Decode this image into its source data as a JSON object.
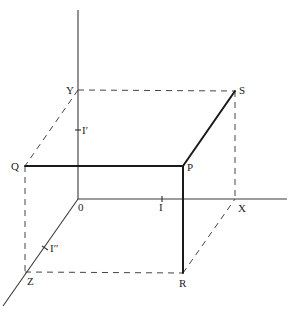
{
  "figure": {
    "width": 291,
    "height": 312,
    "colors": {
      "background": "#ffffff",
      "line": "#1a1a1a",
      "axis": "#3a3a3a",
      "dashed": "#444444",
      "text": "#222222"
    }
  },
  "axes": {
    "origin": {
      "label": "0",
      "x": 78,
      "y": 199
    },
    "y_axis": {
      "from": [
        78,
        199
      ],
      "to": [
        78,
        10
      ]
    },
    "x_axis": {
      "from": [
        78,
        199
      ],
      "to": [
        287,
        199
      ]
    },
    "z_axis": {
      "from": [
        78,
        199
      ],
      "to": [
        3,
        306
      ]
    }
  },
  "points": {
    "Y": {
      "label": "Y",
      "x": 78,
      "y": 90
    },
    "S": {
      "label": "S",
      "x": 235,
      "y": 91
    },
    "Q": {
      "label": "Q",
      "x": 25,
      "y": 166
    },
    "P": {
      "label": "P",
      "x": 183,
      "y": 166
    },
    "X": {
      "label": "X",
      "x": 235,
      "y": 199
    },
    "Z": {
      "label": "Z",
      "x": 25,
      "y": 272
    },
    "R": {
      "label": "R",
      "x": 183,
      "y": 273
    }
  },
  "unit_ticks": {
    "x_unit": {
      "label": "I",
      "x": 162,
      "y": 199
    },
    "y_unit": {
      "label": "I′",
      "x": 78,
      "y": 130
    },
    "z_unit": {
      "label": "I′′",
      "x": 45,
      "y": 248
    }
  },
  "solid_segments": [
    {
      "name": "segment-q-p",
      "from": "Q",
      "to": "P"
    },
    {
      "name": "segment-p-s",
      "from": "P",
      "to": "S"
    },
    {
      "name": "segment-p-r",
      "from": "P",
      "to": "R"
    }
  ],
  "dashed_segments": [
    {
      "name": "dash-y-s",
      "from": "Y",
      "to": "S"
    },
    {
      "name": "dash-y-q",
      "from": "Y",
      "to": "Q"
    },
    {
      "name": "dash-q-z",
      "from": "Q",
      "to": "Z"
    },
    {
      "name": "dash-z-r",
      "from": "Z",
      "to": "R"
    },
    {
      "name": "dash-r-x",
      "from": "R",
      "to": "X"
    },
    {
      "name": "dash-s-x",
      "from": "S",
      "to": "X"
    }
  ]
}
